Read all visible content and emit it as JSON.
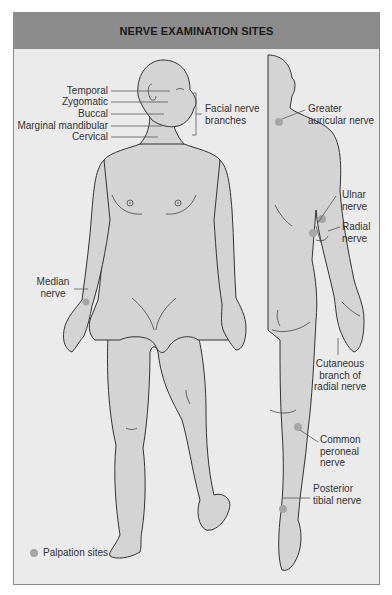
{
  "header": {
    "title": "NERVE EXAMINATION SITES"
  },
  "colors": {
    "header_bg": "#8c8c8c",
    "panel_bg": "#ebebeb",
    "skin": "#d4d4d4",
    "outline": "#333333",
    "palpation_dot": "#a6a6a6"
  },
  "facial_branches": {
    "items": [
      "Temporal",
      "Zygomatic",
      "Buccal",
      "Marginal mandibular",
      "Cervical"
    ],
    "group_label_line1": "Facial nerve",
    "group_label_line2": "branches"
  },
  "labels": {
    "greater_auricular": {
      "line1": "Greater",
      "line2": "auricular nerve"
    },
    "ulnar": {
      "line1": "Ulnar",
      "line2": "nerve"
    },
    "radial": {
      "line1": "Radial",
      "line2": "nerve"
    },
    "median": {
      "line1": "Median",
      "line2": "nerve"
    },
    "cutaneous_radial": {
      "line1": "Cutaneous",
      "line2": "branch of",
      "line3": "radial nerve"
    },
    "common_peroneal": {
      "line1": "Common",
      "line2": "peroneal",
      "line3": "nerve"
    },
    "posterior_tibial": {
      "line1": "Posterior",
      "line2": "tibial nerve"
    }
  },
  "legend": {
    "icon": "palpation-dot-icon",
    "text": "Palpation sites"
  }
}
